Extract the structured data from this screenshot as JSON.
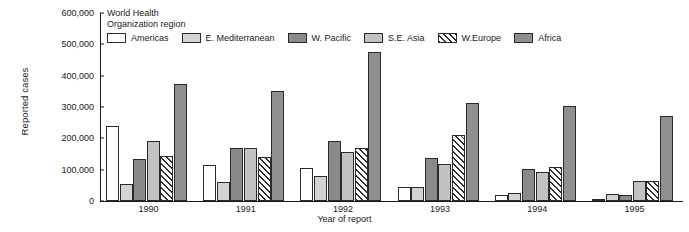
{
  "chart_data": {
    "type": "bar",
    "title": "",
    "xlabel": "Year of report",
    "ylabel": "Reported cases",
    "categories": [
      "1990",
      "1991",
      "1992",
      "1993",
      "1994",
      "1995"
    ],
    "ylim": [
      0,
      600000
    ],
    "yticks": [
      0,
      100000,
      200000,
      300000,
      400000,
      500000,
      600000
    ],
    "ytick_labels": [
      "0",
      "100,000",
      "200,000",
      "300,000",
      "400,000",
      "500,000",
      "600,000"
    ],
    "grid": false,
    "legend_position": "top",
    "legend_title": "World Health Organization region",
    "legend_title_line1": "World Health",
    "legend_title_line2": "Organization region",
    "series": [
      {
        "name": "Americas",
        "color": "#ffffff",
        "pattern": "solid",
        "values": [
          240000,
          115000,
          105000,
          45000,
          20000,
          8000
        ]
      },
      {
        "name": "E. Mediterranean",
        "color": "#d3d3d3",
        "pattern": "solid",
        "values": [
          55000,
          60000,
          80000,
          45000,
          25000,
          22000
        ]
      },
      {
        "name": "W. Pacific",
        "color": "#8a8a8a",
        "pattern": "solid",
        "values": [
          135000,
          168000,
          192000,
          138000,
          103000,
          20000
        ]
      },
      {
        "name": "S.E. Asia",
        "color": "#c2c2c2",
        "pattern": "solid",
        "values": [
          190000,
          170000,
          158000,
          118000,
          92000,
          65000
        ]
      },
      {
        "name": "W.Europe",
        "color": "#ffffff",
        "pattern": "hatch",
        "values": [
          145000,
          140000,
          168000,
          212000,
          108000,
          65000
        ]
      },
      {
        "name": "Africa",
        "color": "#8f8f8f",
        "pattern": "solid",
        "values": [
          375000,
          352000,
          475000,
          312000,
          302000,
          272000
        ]
      }
    ]
  }
}
